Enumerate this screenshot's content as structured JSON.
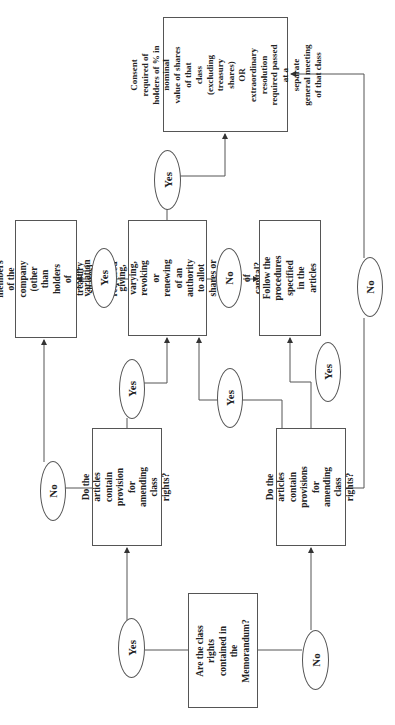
{
  "diagram": {
    "type": "flowchart",
    "orientation": "rotated-90-ccw",
    "nodes": {
      "memorandum_question": "Are the class rights\ncontained in the\nMemorandum?",
      "articles_provision_question_a": "Do the articles contain\nprovision for amending\nclass rights?",
      "articles_provision_question_b": "Do the articles contain\nprovisions for amending\nclass rights?",
      "variation_question": "Is the variation\nconnected to the giving,\nvarying, revoking or\nrenewing of an authority\nto allot shares or a\nreduction of capital?",
      "consent_all_members": "Consent of all members\nof the company (other\nthan holders of treasury\nshares) is required",
      "follow_procedures": "Follow the procedures\nspecified in the articles",
      "consent_class_holders": "Consent required of\nholders of % in nominal\nvalue of shares of that\nclass\n(excluding treasury\nshares)\nOR\nextraordinary resolution\nrequired passed at a\nseparate general meeting\nof that class"
    },
    "labels": {
      "memo_yes": "Yes",
      "memo_no": "No",
      "articles_a_yes": "Yes",
      "articles_a_no": "No",
      "articles_b_yes_to_variation": "Yes",
      "articles_b_yes_to_procedures": "Yes",
      "articles_b_no": "No",
      "variation_yes_all": "Yes",
      "variation_yes_class": "Yes",
      "variation_no": "No"
    }
  }
}
